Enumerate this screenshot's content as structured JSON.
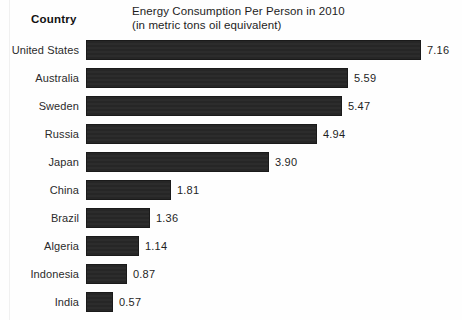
{
  "header": {
    "country_column_label": "Country"
  },
  "chart_data": {
    "type": "bar",
    "orientation": "horizontal",
    "title": "Energy Consumption Per Person in 2010",
    "subtitle": "(in metric tons oil equivalent)",
    "xlabel": "",
    "ylabel": "Country",
    "grid": false,
    "legend": null,
    "xlim": [
      0,
      7.16
    ],
    "value_format": "2-decimal",
    "categories": [
      "United States",
      "Australia",
      "Sweden",
      "Russia",
      "Japan",
      "China",
      "Brazil",
      "Algeria",
      "Indonesia",
      "India"
    ],
    "values": [
      7.16,
      5.59,
      5.47,
      4.94,
      3.9,
      1.81,
      1.36,
      1.14,
      0.87,
      0.57
    ],
    "value_labels": [
      "7.16",
      "5.59",
      "5.47",
      "4.94",
      "3.90",
      "1.81",
      "1.36",
      "1.14",
      "0.87",
      "0.57"
    ],
    "bar_color": "#272727",
    "background_color": "#fefefe",
    "text_color": "#1f1f1f"
  },
  "layout": {
    "bar_origin_x": 86,
    "px_per_unit": 46.8,
    "row_pitch": 28,
    "row_start_y": 0
  }
}
